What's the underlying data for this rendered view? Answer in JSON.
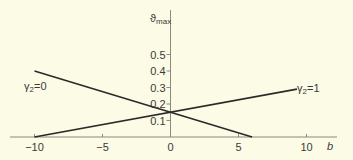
{
  "chart_data": {
    "type": "line",
    "title": "",
    "xlabel": "b",
    "ylabel": "ϑmax",
    "ylabel_main": "ϑ",
    "ylabel_sub": "max",
    "xlim": [
      -12.5,
      11
    ],
    "ylim": [
      0,
      0.6
    ],
    "x_ticks": [
      -10,
      -5,
      0,
      5,
      10
    ],
    "x_tick_labels": [
      "−10",
      "−5",
      "0",
      "5",
      "10"
    ],
    "y_ticks": [
      0.1,
      0.2,
      0.3,
      0.4,
      0.5
    ],
    "y_tick_labels": [
      "0.1",
      "0.2",
      "0.3",
      "0.4",
      "0.5"
    ],
    "grid": false,
    "series": [
      {
        "name": "γ2=0",
        "label_main": "γ",
        "label_sub": "2",
        "label_eq": "=0",
        "x": [
          -10,
          6
        ],
        "values": [
          0.4,
          0.0
        ]
      },
      {
        "name": "γ2=1",
        "label_main": "γ",
        "label_sub": "2",
        "label_eq": "=1",
        "x": [
          -10,
          9.3
        ],
        "values": [
          0.0,
          0.29
        ]
      }
    ],
    "annotations": [
      "γ2=0",
      "γ2=1"
    ],
    "colors": {
      "background": "#fbfbe6",
      "line": "#2a2a2a",
      "axis": "#8a8a80"
    }
  }
}
